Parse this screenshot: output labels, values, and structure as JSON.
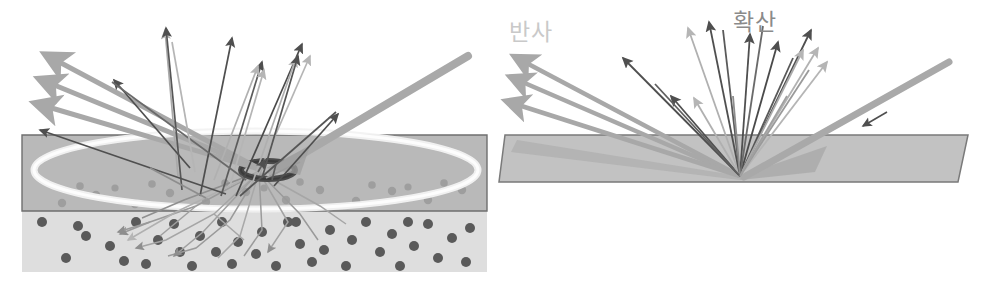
{
  "figure": {
    "panels": [
      {
        "id": "left",
        "name": "translucent-material-panel",
        "description": "Light beam entering a translucent slab over a scattering medium; rays scatter inside and exit in many directions",
        "labels": []
      },
      {
        "id": "right",
        "name": "opaque-material-panel",
        "description": "Light beam striking an opaque flat slab; reflection lobe and diffuse fan of rays leave from one point",
        "labels": [
          {
            "key": "reflection",
            "text": "반사",
            "color": "#c9c9c9",
            "x": 12,
            "y": 40
          },
          {
            "key": "diffusion",
            "text": "확산",
            "color": "#8a8a8a",
            "x": 236,
            "y": 30
          }
        ]
      }
    ],
    "colors": {
      "background": "#ffffff",
      "slab_top": "#b9b9b9",
      "slab_bottom": "#dcdcdc",
      "slab_border": "#6f6f6f",
      "slab_right": "#c2c2c2",
      "ellipse_ring": "#f2f2f2",
      "ring_dark": "#4a4a4a",
      "particle_dot_dark": "#5a5a5a",
      "particle_dot_faded": "#9e9e9e",
      "ray_dark": "#4f4f4f",
      "ray_mid": "#8e8e8e",
      "ray_light": "#b5b5b5",
      "beam_gray": "#a9a9a9",
      "reflect_arrow": "#a8a8a8"
    },
    "geometry": {
      "canvas": {
        "width": 993,
        "height": 285
      },
      "left_slab": {
        "top_y": 135,
        "mid_y": 211,
        "bottom_y": 272,
        "left_x": 22,
        "right_x": 487
      },
      "right_slab": {
        "top_y": 135,
        "bottom_y": 182,
        "left_x": 503,
        "right_x": 968
      },
      "left_hit_point": {
        "x": 259,
        "y": 172
      },
      "right_hit_point": {
        "x": 740,
        "y": 176
      }
    }
  }
}
